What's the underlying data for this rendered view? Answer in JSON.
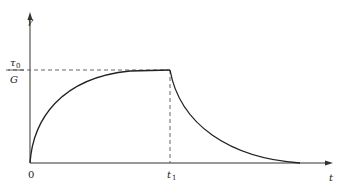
{
  "diagram": {
    "y_axis_label": "γ",
    "x_axis_label": "t",
    "origin_label": "0",
    "t1_label": "t",
    "t1_subscript": "1",
    "level_numerator": "τ",
    "level_numerator_subscript": "0",
    "level_denominator": "G",
    "colors": {
      "curve": "#222222",
      "axes": "#333333",
      "dashed": "#555555"
    }
  }
}
